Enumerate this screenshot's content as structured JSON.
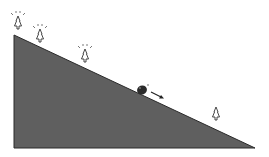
{
  "diagram": {
    "title": "",
    "colors": {
      "slope_fill": "#5f5f5f",
      "slope_edge": "#2a2a2a",
      "rock": "#2b2b2b",
      "tree_stroke": "#333333",
      "background": "#ffffff"
    },
    "elements": {
      "slope": {
        "shape": "right-triangle",
        "points": [
          [
            14,
            35
          ],
          [
            14,
            148
          ],
          [
            255,
            148
          ]
        ]
      },
      "rock": {
        "x": 142,
        "y": 90
      },
      "motion_arrow": {
        "from": [
          151,
          92
        ],
        "to": [
          163,
          98
        ]
      },
      "trees": [
        {
          "x": 18,
          "y": 24,
          "highlighted": true
        },
        {
          "x": 40,
          "y": 37,
          "highlighted": true
        },
        {
          "x": 85,
          "y": 57,
          "highlighted": true
        },
        {
          "x": 216,
          "y": 115,
          "highlighted": false
        }
      ]
    }
  }
}
